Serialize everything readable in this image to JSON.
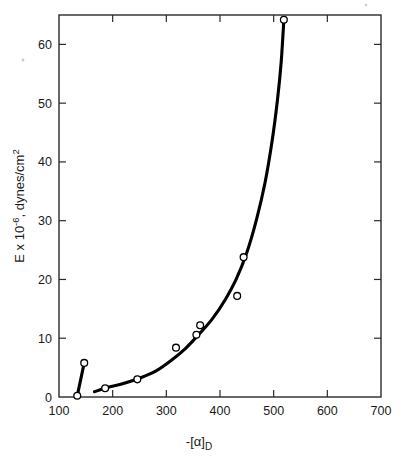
{
  "figure": {
    "background": "#ffffff",
    "ink": "#000000"
  },
  "chart_data": {
    "type": "scatter",
    "title": "",
    "subtitle": "",
    "xlabel": "-[α]",
    "xlabel_sub": "D",
    "xlabel_full": "-[α]D",
    "ylabel_parts": {
      "lead": "E x 10",
      "exponent": "-6",
      "rest": ", dynes/cm",
      "rest_exponent": "2"
    },
    "ylabel_full": "E x 10⁻⁶, dynes/cm²",
    "xlim": [
      100,
      700
    ],
    "ylim": [
      0,
      65
    ],
    "xticks": [
      100,
      200,
      300,
      400,
      500,
      600,
      700
    ],
    "xtick_labels": [
      "100",
      "200",
      "300",
      "400",
      "500",
      "600",
      "700"
    ],
    "yticks": [
      0,
      10,
      20,
      30,
      40,
      50,
      60
    ],
    "ytick_labels": [
      "0",
      "10",
      "20",
      "30",
      "40",
      "50",
      "60"
    ],
    "grid": false,
    "legend": null,
    "legend_position": "none",
    "tick_direction": "in",
    "frame": "full-box",
    "marker_style": "open-circle",
    "points": [
      {
        "x": 134,
        "y": 0.2
      },
      {
        "x": 147,
        "y": 5.8
      },
      {
        "x": 186,
        "y": 1.5
      },
      {
        "x": 246,
        "y": 3.0
      },
      {
        "x": 318,
        "y": 8.4
      },
      {
        "x": 356,
        "y": 10.6
      },
      {
        "x": 363,
        "y": 12.2
      },
      {
        "x": 432,
        "y": 17.2
      },
      {
        "x": 444,
        "y": 23.8
      },
      {
        "x": 519,
        "y": 64.2
      }
    ],
    "curves": [
      {
        "name": "short-steep-segment",
        "points": [
          {
            "x": 134,
            "y": 0.2
          },
          {
            "x": 147,
            "y": 5.8
          }
        ]
      },
      {
        "name": "main-trend-curve",
        "points": [
          {
            "x": 166,
            "y": 0.9
          },
          {
            "x": 190,
            "y": 1.6
          },
          {
            "x": 220,
            "y": 2.3
          },
          {
            "x": 250,
            "y": 3.2
          },
          {
            "x": 280,
            "y": 4.4
          },
          {
            "x": 310,
            "y": 6.3
          },
          {
            "x": 335,
            "y": 8.2
          },
          {
            "x": 360,
            "y": 10.6
          },
          {
            "x": 385,
            "y": 13.2
          },
          {
            "x": 410,
            "y": 16.6
          },
          {
            "x": 430,
            "y": 20.0
          },
          {
            "x": 450,
            "y": 24.6
          },
          {
            "x": 468,
            "y": 30.2
          },
          {
            "x": 484,
            "y": 36.5
          },
          {
            "x": 497,
            "y": 43.5
          },
          {
            "x": 507,
            "y": 50.5
          },
          {
            "x": 514,
            "y": 57.0
          },
          {
            "x": 519,
            "y": 64.2
          }
        ]
      }
    ]
  }
}
